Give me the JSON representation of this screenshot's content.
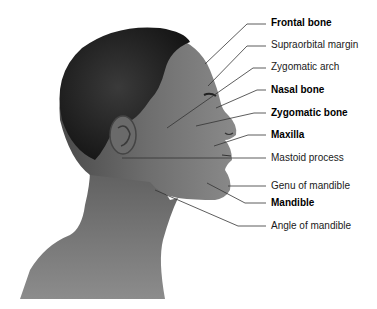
{
  "figure": {
    "colors": {
      "background": "#ffffff",
      "hair": "#1e1e1e",
      "skin_dark": "#555555",
      "skin_mid": "#7a7a7a",
      "skin_light": "#9a9a9a",
      "leader_line": "#333333",
      "label_text": "#1a1a1a"
    }
  },
  "labels": [
    {
      "text": "Frontal bone",
      "bold": true
    },
    {
      "text": "Supraorbital margin",
      "bold": false
    },
    {
      "text": "Zygomatic arch",
      "bold": false
    },
    {
      "text": "Nasal bone",
      "bold": true
    },
    {
      "text": "Zygomatic bone",
      "bold": true
    },
    {
      "text": "Maxilla",
      "bold": true
    },
    {
      "text": "Mastoid process",
      "bold": false
    },
    {
      "text": "Genu of mandible",
      "bold": false
    },
    {
      "text": "Mandible",
      "bold": true
    },
    {
      "text": "Angle of mandible",
      "bold": false
    }
  ]
}
